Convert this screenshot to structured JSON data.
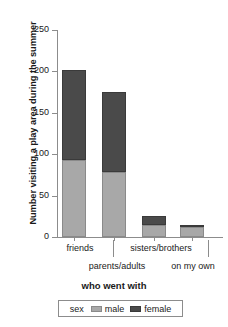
{
  "chart_data": {
    "type": "bar",
    "subtype": "stacked-vertical",
    "title": "",
    "xlabel": "who went with",
    "ylabel": "Number visiting a play area during the summer",
    "categories": [
      "friends",
      "parents/adults",
      "sisters/brothers",
      "on my own"
    ],
    "series": [
      {
        "name": "male",
        "color": "#a8a8a8",
        "values": [
          93,
          79,
          14,
          12
        ]
      },
      {
        "name": "female",
        "color": "#4a4a4a",
        "values": [
          109,
          96,
          12,
          3
        ]
      }
    ],
    "totals": [
      202,
      175,
      26,
      15
    ],
    "ylim": [
      0,
      250
    ],
    "yticks": [
      0,
      50,
      100,
      150,
      200,
      250
    ],
    "ytick_labels": [
      "0",
      "50",
      "100",
      "150",
      "200",
      "250"
    ],
    "grid": false,
    "legend": {
      "title": "sex",
      "position": "bottom",
      "entries": [
        {
          "label": "male",
          "color": "#a8a8a8"
        },
        {
          "label": "female",
          "color": "#4a4a4a"
        }
      ]
    }
  },
  "axis": {
    "y_title": "Number visiting a play area during the summer",
    "x_title": "who went with",
    "y_tick_labels": [
      "250",
      "200",
      "150",
      "100",
      "50",
      "0"
    ]
  },
  "x_labels": {
    "row1": [
      "friends",
      "sisters/brothers"
    ],
    "row2": [
      "parents/adults",
      "on my own"
    ]
  },
  "legend": {
    "title": "sex",
    "male_label": "male",
    "female_label": "female"
  },
  "colors": {
    "male": "#a8a8a8",
    "female": "#4a4a4a",
    "axis": "#8c8c8c",
    "text": "#1a1a1a",
    "background": "#ffffff"
  }
}
